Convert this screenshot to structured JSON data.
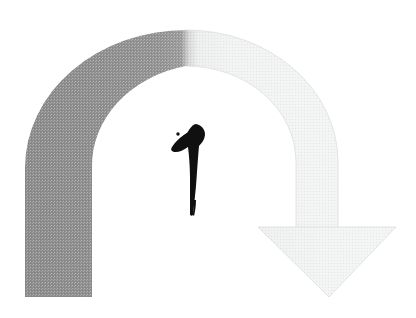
{
  "canvas": {
    "width": 416,
    "height": 318,
    "background_color": "#ffffff",
    "title": "Curved gradient arrow with black brush-stroke mark"
  },
  "shapes": {
    "arc_arrow": {
      "name": "curved-arrow",
      "description": "Thick semicircular band sweeping from lower-left up over an apex and down to the lower-right, terminating in a downward-pointing arrowhead.",
      "direction": "clockwise-left-to-right-descending",
      "gradient": {
        "type": "linear-horizontal",
        "from_color": "#8b8b8b",
        "mid_color": "#c9c9c9",
        "to_color": "#f4f4f4",
        "transition_x": 190
      },
      "band": {
        "outer_radius_x": 152,
        "outer_radius_y": 132,
        "inner_radius_x": 112,
        "inner_radius_y": 95,
        "center_x": 186,
        "center_y": 168,
        "left_foot_top_y": 297,
        "left_foot_outer_x": 25,
        "left_foot_inner_x": 92,
        "apex_outer_y": 30,
        "apex_inner_y": 68
      },
      "arrowhead": {
        "name": "arrowhead-triangle",
        "left_barb_x": 258,
        "right_barb_x": 396,
        "barb_y": 227,
        "tip_x": 329,
        "tip_y": 297,
        "fill_color": "#f2f2f2",
        "edge_color": "#e2e2e2"
      },
      "texture": "halftone-dither"
    },
    "ink_mark": {
      "name": "black-brush-stroke",
      "description": "Solid black calligraphic brush mark resembling a stylized numeral one or perched bird, with a tapering vertical tail.",
      "fill_color": "#101010",
      "bounds": {
        "x": 172,
        "y": 124,
        "width": 34,
        "height": 92
      },
      "dot": {
        "cx": 178,
        "cy": 134,
        "r": 1.6
      }
    }
  },
  "labels": {
    "figure_caption": ""
  }
}
